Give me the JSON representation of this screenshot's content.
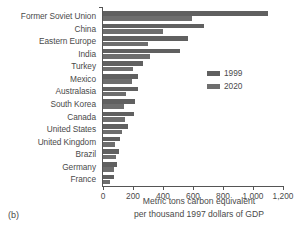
{
  "panel_label": "(b)",
  "legend": {
    "position": "upper-right",
    "entries": [
      {
        "label": "1999",
        "color": "#606060"
      },
      {
        "label": "2020",
        "color": "#6e6e6e"
      }
    ]
  },
  "axis": {
    "xlabel_line1": "Metric tons carbon equivalent",
    "xlabel_line2": "per thousand 1997 dollars of GDP",
    "ticks": [
      "0",
      "200",
      "400",
      "600",
      "800",
      "1,000",
      "1,200"
    ]
  },
  "chart_data": {
    "type": "bar",
    "orientation": "horizontal",
    "title": "",
    "subtitle": "",
    "xlabel": "Metric tons carbon equivalent per thousand 1997 dollars of GDP",
    "ylabel": "",
    "xlim": [
      0,
      1200
    ],
    "xticks": [
      0,
      200,
      400,
      600,
      800,
      1000,
      1200
    ],
    "xticklabels": [
      "0",
      "200",
      "400",
      "600",
      "800",
      "1,000",
      "1,200"
    ],
    "grid": false,
    "legend_position": "upper right",
    "categories": [
      "Former Soviet Union",
      "China",
      "Eastern Europe",
      "India",
      "Turkey",
      "Mexico",
      "Australasia",
      "South Korea",
      "Canada",
      "United States",
      "United Kingdom",
      "Brazil",
      "Germany",
      "France"
    ],
    "series": [
      {
        "name": "1999",
        "color": "#606060",
        "values": [
          1100,
          670,
          565,
          515,
          265,
          235,
          230,
          215,
          208,
          165,
          110,
          105,
          93,
          70
        ]
      },
      {
        "name": "2020",
        "color": "#6e6e6e",
        "values": [
          595,
          400,
          300,
          313,
          200,
          192,
          155,
          143,
          148,
          128,
          80,
          88,
          73,
          48
        ]
      }
    ]
  }
}
